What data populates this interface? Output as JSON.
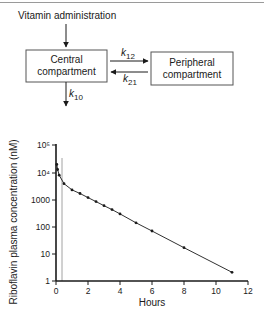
{
  "diagram": {
    "input_label": "Vitamin administration",
    "central_box": {
      "line1": "Central",
      "line2": "compartment"
    },
    "peripheral_box": {
      "line1": "Peripheral",
      "line2": "compartment"
    },
    "k12": {
      "k": "k",
      "sub": "12"
    },
    "k21": {
      "k": "k",
      "sub": "21"
    },
    "k10": {
      "k": "k",
      "sub": "10"
    }
  },
  "chart_data": {
    "type": "line",
    "title": "",
    "xlabel": "Hours",
    "ylabel": "Riboflavin plasma concentration (nM)",
    "xlim": [
      0,
      12
    ],
    "ylim": [
      1,
      100000
    ],
    "yscale": "log",
    "x_ticks": [
      "0",
      "2",
      "4",
      "6",
      "8",
      "10",
      "12"
    ],
    "y_ticks": [
      "1",
      "10",
      "100",
      "1000",
      "10⁴",
      "10⁵"
    ],
    "grid": false,
    "legend": null,
    "annotations": [
      {
        "type": "vertical-line",
        "x": 0.4,
        "color": "#8a8a8a"
      }
    ],
    "series": [
      {
        "name": "Riboflavin",
        "x": [
          0.05,
          0.1,
          0.2,
          0.5,
          1.0,
          1.5,
          2.0,
          2.5,
          3.0,
          3.5,
          4.0,
          5.0,
          6.0,
          8.0,
          11.0
        ],
        "values": [
          20000,
          13000,
          8000,
          3900,
          2300,
          1700,
          1200,
          850,
          600,
          430,
          300,
          140,
          70,
          17,
          2.1
        ]
      }
    ]
  }
}
